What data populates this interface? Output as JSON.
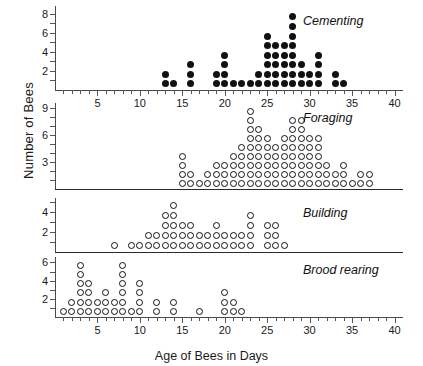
{
  "chart_data": {
    "type": "scatter",
    "title": "",
    "xlabel": "Age of Bees in Days",
    "ylabel": "Number of Bees",
    "xlim": [
      0,
      41
    ],
    "xticks_major": [
      5,
      10,
      15,
      20,
      25,
      30,
      35,
      40
    ],
    "xtick_step_minor": 1,
    "grid": false,
    "panels": [
      {
        "name": "cementing",
        "label": "Cementing",
        "marker": "filled",
        "ylabel_ticks": [
          2,
          4,
          6,
          8
        ],
        "ylim": [
          0,
          8.8
        ],
        "columns": [
          {
            "x": 13,
            "count": 2
          },
          {
            "x": 14,
            "count": 1
          },
          {
            "x": 16,
            "count": 3
          },
          {
            "x": 19,
            "count": 2
          },
          {
            "x": 20,
            "count": 4
          },
          {
            "x": 21,
            "count": 1
          },
          {
            "x": 22,
            "count": 1
          },
          {
            "x": 23,
            "count": 1
          },
          {
            "x": 24,
            "count": 2
          },
          {
            "x": 25,
            "count": 6
          },
          {
            "x": 26,
            "count": 5
          },
          {
            "x": 27,
            "count": 5
          },
          {
            "x": 28,
            "count": 8
          },
          {
            "x": 29,
            "count": 3
          },
          {
            "x": 30,
            "count": 2
          },
          {
            "x": 31,
            "count": 4
          },
          {
            "x": 33,
            "count": 2
          },
          {
            "x": 34,
            "count": 1
          }
        ]
      },
      {
        "name": "foraging",
        "label": "Foraging",
        "marker": "open",
        "ylabel_ticks": [
          3,
          6,
          9
        ],
        "ylim": [
          0,
          9.6
        ],
        "columns": [
          {
            "x": 15,
            "count": 4
          },
          {
            "x": 16,
            "count": 2
          },
          {
            "x": 17,
            "count": 1
          },
          {
            "x": 18,
            "count": 2
          },
          {
            "x": 19,
            "count": 3
          },
          {
            "x": 20,
            "count": 3
          },
          {
            "x": 21,
            "count": 4
          },
          {
            "x": 22,
            "count": 5
          },
          {
            "x": 23,
            "count": 9
          },
          {
            "x": 24,
            "count": 7
          },
          {
            "x": 25,
            "count": 6
          },
          {
            "x": 26,
            "count": 5
          },
          {
            "x": 27,
            "count": 6
          },
          {
            "x": 28,
            "count": 8
          },
          {
            "x": 29,
            "count": 8
          },
          {
            "x": 30,
            "count": 6
          },
          {
            "x": 31,
            "count": 6
          },
          {
            "x": 32,
            "count": 3
          },
          {
            "x": 33,
            "count": 2
          },
          {
            "x": 34,
            "count": 3
          },
          {
            "x": 35,
            "count": 1
          },
          {
            "x": 36,
            "count": 2
          },
          {
            "x": 37,
            "count": 2
          }
        ]
      },
      {
        "name": "building",
        "label": "Building",
        "marker": "open",
        "ylabel_ticks": [
          2,
          4
        ],
        "ylim": [
          0,
          5.4
        ],
        "columns": [
          {
            "x": 7,
            "count": 1
          },
          {
            "x": 9,
            "count": 1
          },
          {
            "x": 10,
            "count": 1
          },
          {
            "x": 11,
            "count": 2
          },
          {
            "x": 12,
            "count": 2
          },
          {
            "x": 13,
            "count": 4
          },
          {
            "x": 14,
            "count": 5
          },
          {
            "x": 15,
            "count": 3
          },
          {
            "x": 16,
            "count": 3
          },
          {
            "x": 17,
            "count": 2
          },
          {
            "x": 18,
            "count": 2
          },
          {
            "x": 19,
            "count": 3
          },
          {
            "x": 20,
            "count": 2
          },
          {
            "x": 21,
            "count": 2
          },
          {
            "x": 22,
            "count": 2
          },
          {
            "x": 23,
            "count": 4
          },
          {
            "x": 25,
            "count": 3
          },
          {
            "x": 26,
            "count": 3
          },
          {
            "x": 27,
            "count": 1
          }
        ]
      },
      {
        "name": "brood-rearing",
        "label": "Brood rearing",
        "marker": "open",
        "ylabel_ticks": [
          2,
          4,
          6
        ],
        "ylim": [
          0,
          6.6
        ],
        "columns": [
          {
            "x": 1,
            "count": 1
          },
          {
            "x": 2,
            "count": 2
          },
          {
            "x": 3,
            "count": 6
          },
          {
            "x": 4,
            "count": 4
          },
          {
            "x": 5,
            "count": 2
          },
          {
            "x": 6,
            "count": 3
          },
          {
            "x": 7,
            "count": 2
          },
          {
            "x": 8,
            "count": 6
          },
          {
            "x": 9,
            "count": 1
          },
          {
            "x": 10,
            "count": 4
          },
          {
            "x": 12,
            "count": 2
          },
          {
            "x": 14,
            "count": 2
          },
          {
            "x": 17,
            "count": 1
          },
          {
            "x": 20,
            "count": 3
          },
          {
            "x": 21,
            "count": 2
          },
          {
            "x": 22,
            "count": 1
          }
        ]
      }
    ]
  }
}
